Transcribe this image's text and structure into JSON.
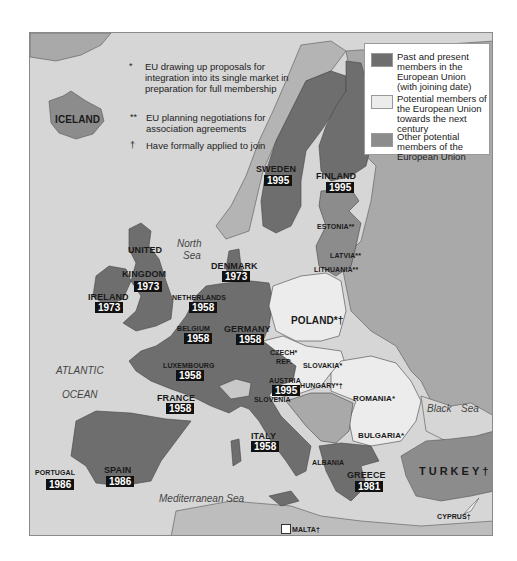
{
  "colors": {
    "sea": "#d6d6d6",
    "eu_member": "#6e6e6e",
    "potential_member": "#ececec",
    "other_potential": "#8c8c8c",
    "non_eu_land": "#a9a9a9",
    "frame": "#8a8a8a"
  },
  "notes": [
    {
      "mark": "*",
      "text": "EU drawing up proposals for integration into its single market in preparation for full membership"
    },
    {
      "mark": "**",
      "text": "EU planning negotiations for association agreements"
    },
    {
      "mark": "†",
      "text": "Have formally applied to join"
    }
  ],
  "legend": {
    "items": [
      {
        "label": "Past and present members in the European Union (with joining date)",
        "swatch": "eu_member"
      },
      {
        "label": "Potential members of the European Union towards the next century",
        "swatch": "potential_member"
      },
      {
        "label": "Other potential members of the European Union",
        "swatch": "other_potential"
      }
    ]
  },
  "seas": {
    "north_sea_1": "North",
    "north_sea_2": "Sea",
    "atlantic_1": "ATLANTIC",
    "atlantic_2": "OCEAN",
    "mediterranean": "Mediterranean Sea",
    "black_sea_1": "Black",
    "black_sea_2": "Sea"
  },
  "countries": {
    "iceland": {
      "name": "ICELAND"
    },
    "sweden": {
      "name": "SWEDEN",
      "year": "1995"
    },
    "finland": {
      "name": "FINLAND",
      "year": "1995"
    },
    "estonia": {
      "name": "ESTONIA**"
    },
    "latvia": {
      "name": "LATVIA**"
    },
    "lithuania": {
      "name": "LITHUANIA**"
    },
    "uk": {
      "name1": "UNITED",
      "name2": "KINGDOM",
      "year": "1973"
    },
    "ireland": {
      "name": "IRELAND",
      "year": "1973"
    },
    "denmark": {
      "name": "DENMARK",
      "year": "1973"
    },
    "netherlands": {
      "name": "NETHERLANDS",
      "year": "1958"
    },
    "belgium": {
      "name": "BELGIUM",
      "year": "1958"
    },
    "germany": {
      "name": "GERMANY",
      "year": "1958"
    },
    "luxembourg": {
      "name": "LUXEMBOURG",
      "year": "1958"
    },
    "france": {
      "name": "FRANCE",
      "year": "1958"
    },
    "poland": {
      "name": "POLAND*†"
    },
    "czech": {
      "name1": "CZECH*",
      "name2": "REP."
    },
    "slovakia": {
      "name": "SLOVAKIA*"
    },
    "austria": {
      "name": "AUSTRIA",
      "year": "1995"
    },
    "hungary": {
      "name": "HUNGARY*†"
    },
    "slovenia": {
      "name": "SLOVENIA"
    },
    "romania": {
      "name": "ROMANIA*"
    },
    "bulgaria": {
      "name": "BULGARIA*"
    },
    "italy": {
      "name": "ITALY",
      "year": "1958"
    },
    "albania": {
      "name": "ALBANIA"
    },
    "greece": {
      "name": "GREECE",
      "year": "1981"
    },
    "turkey": {
      "name": "TURKEY†"
    },
    "cyprus": {
      "name": "CYPRUS†"
    },
    "portugal": {
      "name": "PORTUGAL",
      "year": "1986"
    },
    "spain": {
      "name": "SPAIN",
      "year": "1986"
    },
    "malta": {
      "name": "MALTA†"
    }
  }
}
